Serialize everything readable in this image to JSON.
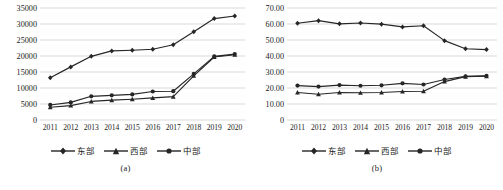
{
  "figure": {
    "panels": [
      {
        "caption": "(a)",
        "chart_data": {
          "type": "line",
          "title": "",
          "xlabel": "",
          "ylabel": "",
          "categories": [
            "2011",
            "2012",
            "2013",
            "2014",
            "2015",
            "2016",
            "2017",
            "2018",
            "2019",
            "2020"
          ],
          "ylim": [
            0,
            35000
          ],
          "yticks": [
            "0",
            "5000",
            "10000",
            "15000",
            "20000",
            "25000",
            "30000",
            "35000"
          ],
          "ytick_values": [
            0,
            5000,
            10000,
            15000,
            20000,
            25000,
            30000,
            35000
          ],
          "grid": true,
          "legend_position": "bottom",
          "series": [
            {
              "name": "东部",
              "marker": "diamond",
              "color": "#262626",
              "values": [
                13200,
                16600,
                19900,
                21600,
                21800,
                22100,
                23500,
                27600,
                31700,
                32500
              ]
            },
            {
              "name": "西部",
              "marker": "triangle",
              "color": "#262626",
              "values": [
                4000,
                4500,
                5800,
                6200,
                6500,
                6900,
                7300,
                13800,
                19700,
                20400
              ]
            },
            {
              "name": "中部",
              "marker": "circle",
              "color": "#262626",
              "values": [
                4700,
                5500,
                7400,
                7700,
                8000,
                8900,
                9000,
                14400,
                19900,
                20600
              ]
            }
          ]
        }
      },
      {
        "caption": "(b)",
        "chart_data": {
          "type": "line",
          "title": "",
          "xlabel": "",
          "ylabel": "",
          "categories": [
            "2011",
            "2012",
            "2013",
            "2014",
            "2015",
            "2016",
            "2017",
            "2018",
            "2019",
            "2020"
          ],
          "ylim": [
            0,
            70
          ],
          "yticks": [
            "0",
            "10.00",
            "20.00",
            "30.00",
            "40.00",
            "50.00",
            "60.00",
            "70.00"
          ],
          "ytick_values": [
            0,
            10,
            20,
            30,
            40,
            50,
            60,
            70
          ],
          "grid": true,
          "legend_position": "bottom",
          "series": [
            {
              "name": "东部",
              "marker": "diamond",
              "color": "#262626",
              "values": [
                60.5,
                62.1,
                60.1,
                60.6,
                59.9,
                58.2,
                58.9,
                49.6,
                44.5,
                44.0
              ]
            },
            {
              "name": "西部",
              "marker": "triangle",
              "color": "#262626",
              "values": [
                17.2,
                16.1,
                17.2,
                17.0,
                17.2,
                17.8,
                18.0,
                24.0,
                27.1,
                27.4
              ]
            },
            {
              "name": "中部",
              "marker": "circle",
              "color": "#262626",
              "values": [
                21.5,
                20.9,
                21.8,
                21.4,
                21.7,
                22.9,
                22.2,
                25.3,
                27.3,
                27.6
              ]
            }
          ]
        }
      }
    ]
  }
}
